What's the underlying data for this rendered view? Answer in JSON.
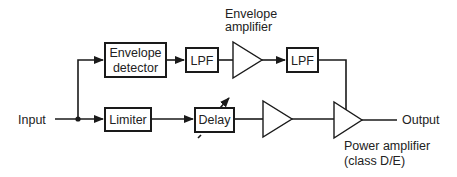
{
  "diagram": {
    "nodes": {
      "input": {
        "label": "Input"
      },
      "output": {
        "label": "Output"
      },
      "envelope_detector": {
        "line1": "Envelope",
        "line2": "detector"
      },
      "lpf1": {
        "label": "LPF"
      },
      "envelope_amplifier": {
        "line1": "Envelope",
        "line2": "amplifier"
      },
      "lpf2": {
        "label": "LPF"
      },
      "limiter": {
        "label": "Limiter"
      },
      "delay": {
        "label": "Delay"
      },
      "driver_amplifier": {
        "label": ""
      },
      "power_amplifier": {
        "line1": "Power amplifier",
        "line2": "(class D/E)"
      }
    },
    "edges": [
      [
        "input",
        "envelope_detector"
      ],
      [
        "input",
        "limiter"
      ],
      [
        "envelope_detector",
        "lpf1"
      ],
      [
        "lpf1",
        "envelope_amplifier"
      ],
      [
        "envelope_amplifier",
        "lpf2"
      ],
      [
        "lpf2",
        "power_amplifier"
      ],
      [
        "limiter",
        "delay"
      ],
      [
        "delay",
        "driver_amplifier"
      ],
      [
        "driver_amplifier",
        "power_amplifier"
      ],
      [
        "power_amplifier",
        "output"
      ]
    ]
  }
}
